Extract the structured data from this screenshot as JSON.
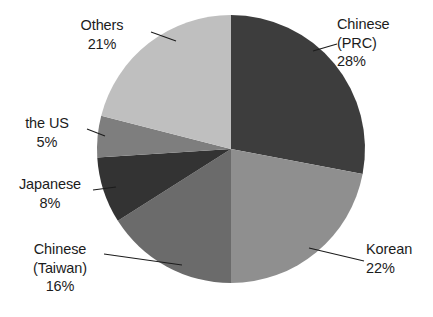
{
  "chart_data": {
    "type": "pie",
    "title": "",
    "categories": [
      "Chinese (PRC)",
      "Korean",
      "Chinese (Taiwan)",
      "Japanese",
      "the US",
      "Others"
    ],
    "values": [
      28,
      22,
      16,
      8,
      5,
      21
    ],
    "value_unit": "%",
    "start_angle_deg": 0,
    "direction": "clockwise",
    "legend": "none",
    "labels_position": "outside-with-leader-lines",
    "grid": false,
    "slices": [
      {
        "name": "chinese-prc",
        "label_lines": [
          "Chinese",
          "(PRC)"
        ],
        "percent_text": "28%",
        "value": 28,
        "color": "#3d3d3d",
        "start_deg": 0,
        "end_deg": 100.8
      },
      {
        "name": "korean",
        "label_lines": [
          "Korean"
        ],
        "percent_text": "22%",
        "value": 22,
        "color": "#8f8f8f",
        "start_deg": 100.8,
        "end_deg": 180.0
      },
      {
        "name": "chinese-taiwan",
        "label_lines": [
          "Chinese",
          "(Taiwan)"
        ],
        "percent_text": "16%",
        "value": 16,
        "color": "#6b6b6b",
        "start_deg": 180.0,
        "end_deg": 237.6
      },
      {
        "name": "japanese",
        "label_lines": [
          "Japanese"
        ],
        "percent_text": "8%",
        "value": 8,
        "color": "#333333",
        "start_deg": 237.6,
        "end_deg": 266.4
      },
      {
        "name": "the-us",
        "label_lines": [
          "the US"
        ],
        "percent_text": "5%",
        "value": 5,
        "color": "#7e7e7e",
        "start_deg": 266.4,
        "end_deg": 284.4
      },
      {
        "name": "others",
        "label_lines": [
          "Others"
        ],
        "percent_text": "21%",
        "value": 21,
        "color": "#bfbfbf",
        "start_deg": 284.4,
        "end_deg": 360.0
      }
    ],
    "colors": {
      "chinese_prc": "#3d3d3d",
      "korean": "#8f8f8f",
      "chinese_taiwan": "#6b6b6b",
      "japanese": "#333333",
      "the_us": "#7e7e7e",
      "others": "#bfbfbf",
      "leader_line": "#1c1c1c",
      "text": "#1c1c1c",
      "background": "#ffffff"
    }
  },
  "labels": {
    "others": {
      "name": "Others",
      "percent": "21%"
    },
    "chinese_prc": {
      "line1": "Chinese",
      "line2": "(PRC)",
      "percent": "28%"
    },
    "the_us": {
      "name": "the US",
      "percent": "5%"
    },
    "japanese": {
      "name": "Japanese",
      "percent": "8%"
    },
    "chinese_taiwan": {
      "line1": "Chinese",
      "line2": "(Taiwan)",
      "percent": "16%"
    },
    "korean": {
      "name": "Korean",
      "percent": "22%"
    }
  }
}
